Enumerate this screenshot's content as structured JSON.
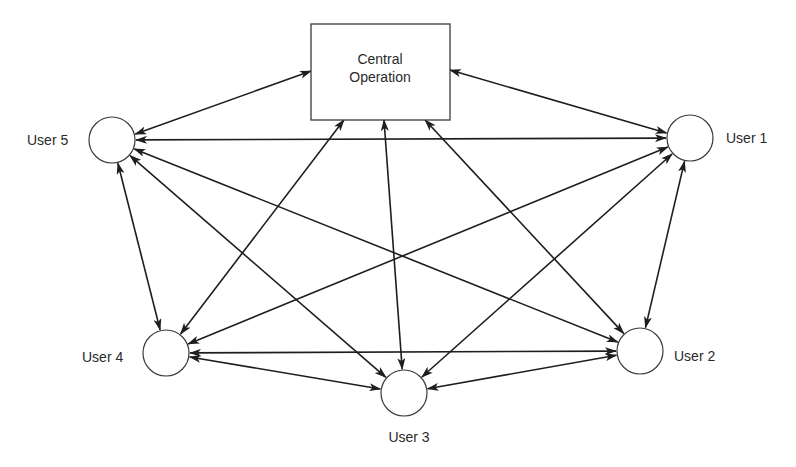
{
  "diagram": {
    "type": "network",
    "central": {
      "id": "central",
      "label_lines": [
        "Central",
        "Operation"
      ]
    },
    "users": [
      {
        "id": "user1",
        "label": "User 1"
      },
      {
        "id": "user2",
        "label": "User 2"
      },
      {
        "id": "user3",
        "label": "User 3"
      },
      {
        "id": "user4",
        "label": "User 4"
      },
      {
        "id": "user5",
        "label": "User 5"
      }
    ],
    "edges": [
      {
        "from": "central",
        "to": "user1",
        "directed": "both"
      },
      {
        "from": "central",
        "to": "user2",
        "directed": "both"
      },
      {
        "from": "central",
        "to": "user3",
        "directed": "both"
      },
      {
        "from": "central",
        "to": "user4",
        "directed": "both"
      },
      {
        "from": "central",
        "to": "user5",
        "directed": "both"
      },
      {
        "from": "user5",
        "to": "user1",
        "directed": "both"
      },
      {
        "from": "user5",
        "to": "user2",
        "directed": "both"
      },
      {
        "from": "user5",
        "to": "user3",
        "directed": "both"
      },
      {
        "from": "user5",
        "to": "user4",
        "directed": "both"
      },
      {
        "from": "user1",
        "to": "user2",
        "directed": "both"
      },
      {
        "from": "user1",
        "to": "user3",
        "directed": "both"
      },
      {
        "from": "user1",
        "to": "user4",
        "directed": "both"
      },
      {
        "from": "user4",
        "to": "user2",
        "directed": "both"
      },
      {
        "from": "user4",
        "to": "user3",
        "directed": "both"
      },
      {
        "from": "user3",
        "to": "user2",
        "directed": "both"
      }
    ]
  },
  "colors": {
    "line": "#1e1e1e",
    "text": "#2a2a2a",
    "background": "#ffffff"
  }
}
